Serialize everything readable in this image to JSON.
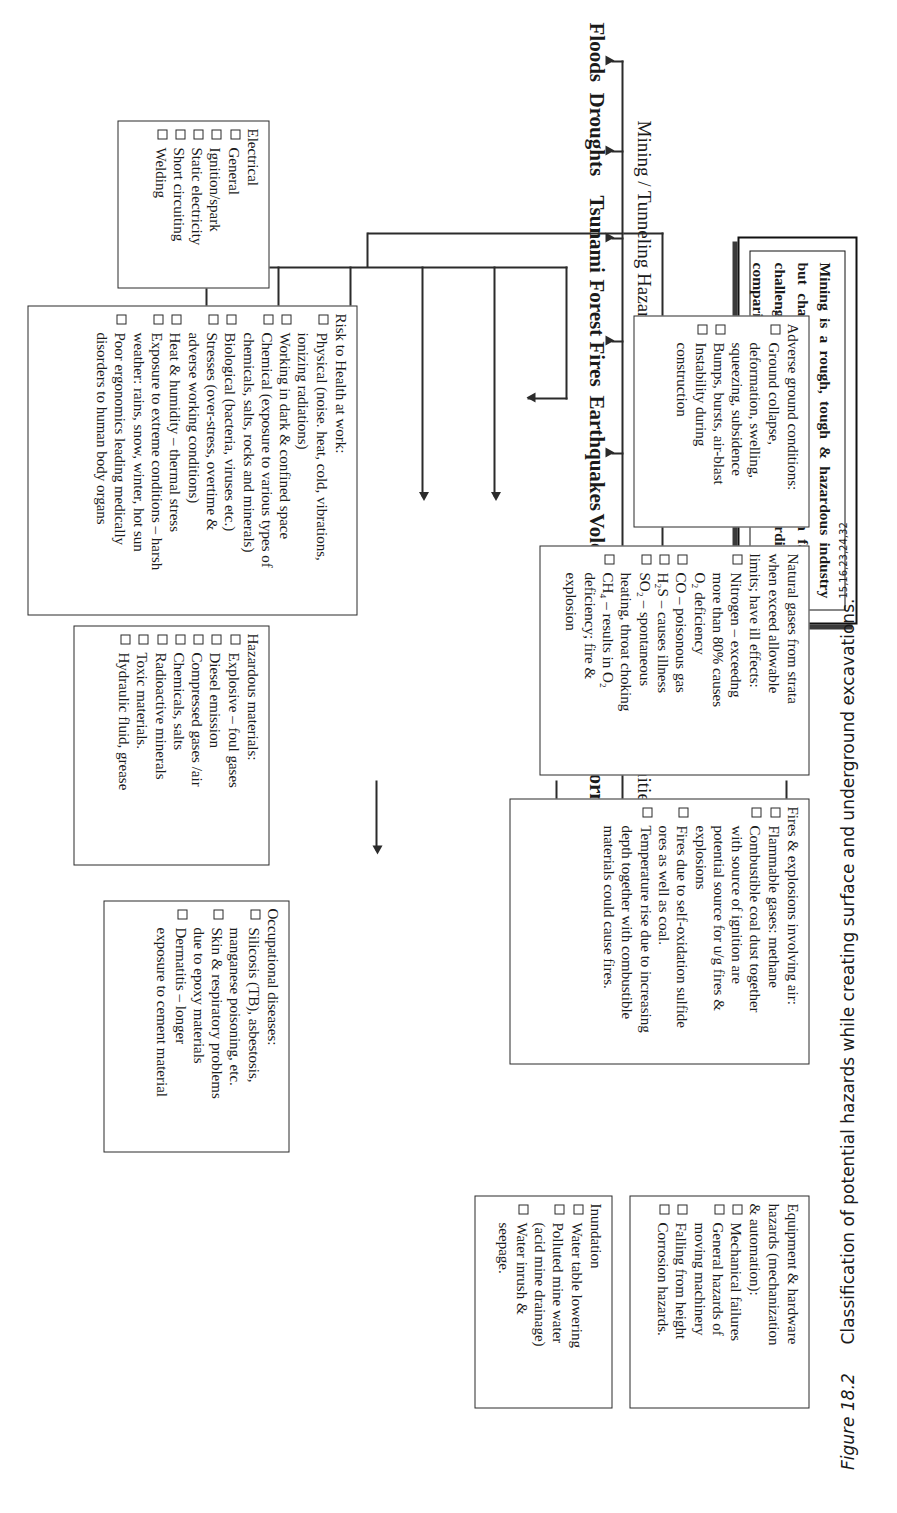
{
  "figure": {
    "number": "Figure 18.2",
    "caption": "Classification of potential hazards while creating surface and underground excavations.",
    "references": "15,16,23,24,32"
  },
  "statement": {
    "text": "Mining is a rough, tough & hazardous industry but challenging and the one who can face this challenge; it is very much rewarding too comparing other industries."
  },
  "hierarchy": {
    "root": "HAZARDS",
    "branches": [
      {
        "label": "Mining / Tunneling Hazards"
      },
      {
        "label": "Natural Disasters (Calamities)"
      }
    ],
    "natural_disaster_types": [
      "Floods",
      "Droughts",
      "Tsunami",
      "Forest Fires",
      "Earthquakes",
      "Volcanoes",
      "Epidemics",
      "Windstorms",
      "Landslides",
      "Others"
    ]
  },
  "boxes": [
    {
      "id": "electrical",
      "title": "Electrical",
      "items": [
        {
          "bullet": true,
          "text": "General"
        },
        {
          "bullet": true,
          "text": "Ignition/spark"
        },
        {
          "bullet": true,
          "text": "Static electricity"
        },
        {
          "bullet": true,
          "text": "Short circuiting"
        },
        {
          "bullet": true,
          "text": "Welding"
        }
      ]
    },
    {
      "id": "risk-to-health",
      "title": "Risk to Health at work:",
      "items": [
        {
          "bullet": true,
          "text": "Physical (noise. heat, cold,  vibrations,"
        },
        {
          "bullet": false,
          "text": "ionizing radiations)"
        },
        {
          "bullet": true,
          "text": "Working in dark & confined space"
        },
        {
          "bullet": true,
          "text": "Chemical (exposure to various types of"
        },
        {
          "bullet": false,
          "text": "chemicals, salts, rocks and minerals)"
        },
        {
          "bullet": true,
          "text": "Biological (bacteria, viruses etc.)"
        },
        {
          "bullet": true,
          "text": "Stresses (over-stress, overtime &"
        },
        {
          "bullet": false,
          "text": "adverse working conditions)"
        },
        {
          "bullet": true,
          "text": "Heat & humidity – thermal stress"
        },
        {
          "bullet": true,
          "text": "Exposure to extreme conditions – harsh"
        },
        {
          "bullet": false,
          "text": "weather: rains, snow, winter, hot sun"
        },
        {
          "bullet": true,
          "text": "Poor ergonomics leading medically"
        },
        {
          "bullet": false,
          "text": "disorders to human body organs"
        }
      ]
    },
    {
      "id": "adverse-ground",
      "title": "Adverse ground conditions:",
      "items": [
        {
          "bullet": true,
          "text": "Ground collapse,"
        },
        {
          "bullet": false,
          "text": "deformation, swelling,"
        },
        {
          "bullet": false,
          "text": "squeezing,  subsidence"
        },
        {
          "bullet": true,
          "text": "Bumps, bursts, air-blast"
        },
        {
          "bullet": true,
          "text": "Instability during"
        },
        {
          "bullet": false,
          "text": "construction"
        }
      ]
    },
    {
      "id": "natural-gases",
      "title": "Natural gases from strata",
      "subtitle": "when exceed allowable\nlimits; have ill effects:",
      "items": [
        {
          "bullet": true,
          "text": "Nitrogen – exceedng"
        },
        {
          "bullet": false,
          "text": "more than 80% causes"
        },
        {
          "bullet": false,
          "text": "O₂ deficiency"
        },
        {
          "bullet": true,
          "text": "CO – poisonous gas"
        },
        {
          "bullet": true,
          "text": "H₂S – causes illness"
        },
        {
          "bullet": true,
          "text": "SO₂ – spontaneous"
        },
        {
          "bullet": false,
          "text": "heating, throat choking"
        },
        {
          "bullet": true,
          "text": "CH₄ – results in O₂"
        },
        {
          "bullet": false,
          "text": "deficiency; fire &"
        },
        {
          "bullet": false,
          "text": "explosion"
        }
      ]
    },
    {
      "id": "hazardous-materials",
      "title": "Hazardous materials:",
      "items": [
        {
          "bullet": true,
          "text": "Explosive – foul gases"
        },
        {
          "bullet": true,
          "text": "Diesel emission"
        },
        {
          "bullet": true,
          "text": "Compressed gases /air"
        },
        {
          "bullet": true,
          "text": "Chemicals, salts"
        },
        {
          "bullet": true,
          "text": "Radioactive minerals"
        },
        {
          "bullet": true,
          "text": "Toxic materials."
        },
        {
          "bullet": true,
          "text": "Hydraulic fluid, grease"
        }
      ]
    },
    {
      "id": "fires-explosions",
      "title": "Fires & explosions involving air:",
      "items": [
        {
          "bullet": true,
          "text": "Flammable gases: methane"
        },
        {
          "bullet": true,
          "text": "Combustible coal dust together"
        },
        {
          "bullet": false,
          "text": "with source of ignition are"
        },
        {
          "bullet": false,
          "text": "potential source for u/g fires &"
        },
        {
          "bullet": false,
          "text": "explosions"
        },
        {
          "bullet": true,
          "text": "Fires due to self-oxidation sulfide"
        },
        {
          "bullet": false,
          "text": "ores as well as coal."
        },
        {
          "bullet": true,
          "text": "Temperature rise due to increasing"
        },
        {
          "bullet": false,
          "text": "depth together with combustible"
        },
        {
          "bullet": false,
          "text": "materials could cause fires."
        }
      ]
    },
    {
      "id": "occupational-diseases",
      "title": "Occupational diseases:",
      "items": [
        {
          "bullet": true,
          "text": "Silicosis (TB), asbestosis,"
        },
        {
          "bullet": false,
          "text": "manganese poisoning, etc."
        },
        {
          "bullet": true,
          "text": "Skin & respiratory problems"
        },
        {
          "bullet": false,
          "text": "due to epoxy materials"
        },
        {
          "bullet": true,
          "text": "Dermatitis – longer"
        },
        {
          "bullet": false,
          "text": "exposure to cement material"
        }
      ]
    },
    {
      "id": "equipment-hardware",
      "title": "Equipment & hardware",
      "subtitle": "hazards (mechanization\n& automation):",
      "items": [
        {
          "bullet": true,
          "text": "Mechanical  failures"
        },
        {
          "bullet": true,
          "text": "General hazards of"
        },
        {
          "bullet": false,
          "text": "moving machinery"
        },
        {
          "bullet": true,
          "text": "Falling from height"
        },
        {
          "bullet": true,
          "text": "Corrosion hazards."
        }
      ]
    },
    {
      "id": "inundation",
      "title": "Inundation",
      "items": [
        {
          "bullet": true,
          "text": "Water table lowering"
        },
        {
          "bullet": true,
          "text": "Polluted  mine  water"
        },
        {
          "bullet": false,
          "text": "(acid mine drainage)"
        },
        {
          "bullet": true,
          "text": "Water inrush &"
        },
        {
          "bullet": false,
          "text": "seepage."
        }
      ]
    }
  ]
}
